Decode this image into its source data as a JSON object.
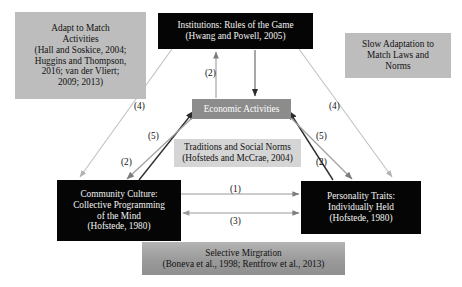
{
  "diagram": {
    "boxes": {
      "adapt": {
        "text": "Adapt to Match\nActivities\n(Hall and Soskice, 2004;\nHuggins and Thompson,\n2016; van der Vliert;\n2009; 2013)",
        "style": "gray",
        "fill": "#bdbdbd",
        "text_color": "#121212"
      },
      "institutions": {
        "text": "Institutions: Rules of the Game\n(Hwang and Powell, 2005)",
        "style": "dark",
        "fill": "#050505",
        "text_color": "#f2f2f2"
      },
      "slow_adaptation": {
        "text": "Slow Adaptation to\nMatch Laws and\nNorms",
        "style": "gray",
        "fill": "#bdbdbd",
        "text_color": "#121212"
      },
      "economic_activities": {
        "text": "Economic Activities",
        "style": "mid",
        "fill": "#8c8c8c",
        "text_color": "#ffffff"
      },
      "traditions": {
        "text": "Traditions and Social Norms\n(Hofsteds and McCrae, 2004)",
        "style": "gray-light",
        "fill": "#d5d5d5",
        "text_color": "#121212"
      },
      "community_culture": {
        "text": "Community Culture:\nCollective Programming\nof the Mind\n(Hofstede, 1980)",
        "style": "dark",
        "fill": "#050505",
        "text_color": "#f2f2f2"
      },
      "personality_traits": {
        "text": "Personality Traits:\nIndividually Held\n(Hofstede, 1980)",
        "style": "dark",
        "fill": "#050505",
        "text_color": "#f2f2f2"
      },
      "selective_migration": {
        "text": "Selective Mirgration\n(Boneva et al., 1998; Rentfrow et al., 2013)",
        "style": "gradient-gray",
        "fill": "#a3a3a3",
        "text_color": "#111111"
      }
    },
    "arrow_labels": {
      "l1": "(1)",
      "l2a": "(2)",
      "l2b": "(2)",
      "l2c": "(2)",
      "l3": "(3)",
      "l4a": "(4)",
      "l4b": "(4)",
      "l5a": "(5)",
      "l5b": "(5)"
    },
    "arrows": [
      {
        "name": "economic-to-institutions",
        "label": "(2)",
        "direction": "up"
      },
      {
        "name": "institutions-to-economic",
        "label": "",
        "direction": "down"
      },
      {
        "name": "community-to-economic",
        "label": "(2)",
        "direction": "up-right"
      },
      {
        "name": "personality-to-economic",
        "label": "(2)",
        "direction": "up-left"
      },
      {
        "name": "economic-to-community",
        "label": "(5)",
        "direction": "down-left"
      },
      {
        "name": "economic-to-personality",
        "label": "(5)",
        "direction": "down-right"
      },
      {
        "name": "institutions-to-community",
        "label": "(4)",
        "direction": "down-left"
      },
      {
        "name": "institutions-to-personality",
        "label": "(4)",
        "direction": "down-right"
      },
      {
        "name": "community-to-personality",
        "label": "(1)",
        "direction": "right"
      },
      {
        "name": "personality-to-community",
        "label": "(3)",
        "direction": "both"
      }
    ]
  }
}
